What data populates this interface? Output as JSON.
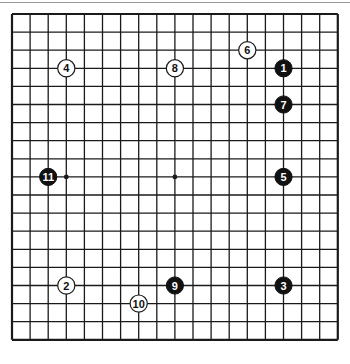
{
  "board": {
    "size": 19,
    "origin_x": 12,
    "origin_y": 14,
    "spacing": 18.1,
    "line_color": "#1a1a1a",
    "hoshi": [
      [
        3,
        9
      ],
      [
        9,
        9
      ]
    ],
    "stones": [
      {
        "move": "1",
        "color": "black",
        "col": 15,
        "row": 3
      },
      {
        "move": "2",
        "color": "white",
        "col": 3,
        "row": 15
      },
      {
        "move": "3",
        "color": "black",
        "col": 15,
        "row": 15
      },
      {
        "move": "4",
        "color": "white",
        "col": 3,
        "row": 3
      },
      {
        "move": "5",
        "color": "black",
        "col": 15,
        "row": 9
      },
      {
        "move": "6",
        "color": "white",
        "col": 13,
        "row": 2
      },
      {
        "move": "7",
        "color": "black",
        "col": 15,
        "row": 5
      },
      {
        "move": "8",
        "color": "white",
        "col": 9,
        "row": 3
      },
      {
        "move": "9",
        "color": "black",
        "col": 9,
        "row": 15
      },
      {
        "move": "10",
        "color": "white",
        "col": 7,
        "row": 16
      },
      {
        "move": "11",
        "color": "black",
        "col": 2,
        "row": 9
      }
    ]
  }
}
